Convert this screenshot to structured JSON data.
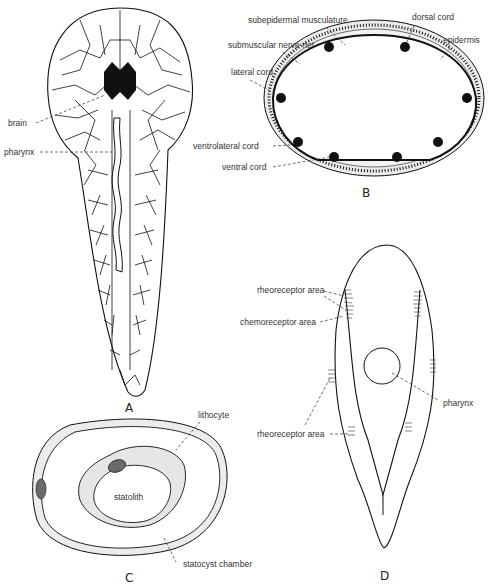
{
  "figure": {
    "panels": [
      {
        "id": "A",
        "label": "A",
        "description": "Whole-body outline with cellular network, brain and pharynx",
        "annotations": [
          "brain",
          "pharynx"
        ]
      },
      {
        "id": "B",
        "label": "B",
        "description": "Cross section showing nerve cords",
        "annotations": [
          "subepidermal musculature",
          "submuscular nerve net",
          "lateral cord",
          "ventrolateral cord",
          "ventral cord",
          "dorsal cord",
          "epidermis"
        ]
      },
      {
        "id": "C",
        "label": "C",
        "description": "Statocyst",
        "annotations": [
          "lithocyte",
          "statolith",
          "statocyst chamber"
        ]
      },
      {
        "id": "D",
        "label": "D",
        "description": "Body outline with receptor areas",
        "annotations": [
          "rheoreceptor area",
          "chemoreceptor area",
          "pharynx",
          "rheoreceptor area"
        ]
      }
    ]
  },
  "labels": {
    "A": {
      "panel": "A",
      "brain": "brain",
      "pharynx": "pharynx"
    },
    "B": {
      "panel": "B",
      "subepidermal_musculature": "subepidermal musculature",
      "submuscular_nerve_net": "submuscular nerve net",
      "lateral_cord": "lateral cord",
      "ventrolateral_cord": "ventrolateral cord",
      "ventral_cord": "ventral cord",
      "dorsal_cord": "dorsal cord",
      "epidermis": "epidermis"
    },
    "C": {
      "panel": "C",
      "lithocyte": "lithocyte",
      "statolith": "statolith",
      "statocyst_chamber": "statocyst chamber"
    },
    "D": {
      "panel": "D",
      "rheoreceptor_top": "rheoreceptor area",
      "chemoreceptor": "chemoreceptor area",
      "pharynx": "pharynx",
      "rheoreceptor_bottom": "rheoreceptor area"
    }
  },
  "colors": {
    "ink": "#111111",
    "label_text": "#333333",
    "shading": "#e6e6e6",
    "nucleus": "#6a6a6a",
    "background": "#ffffff"
  }
}
